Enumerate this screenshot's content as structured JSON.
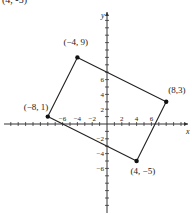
{
  "chart_data": {
    "type": "scatter",
    "title": "",
    "xlabel": "x",
    "ylabel": "y",
    "xlim": [
      -10,
      10
    ],
    "ylim": [
      -12,
      12
    ],
    "grid": false,
    "x_tick_labels": [
      "-6",
      "-4",
      "-2",
      "2",
      "4",
      "6"
    ],
    "y_tick_labels": [
      "6",
      "4",
      "2",
      "-2",
      "-4",
      "-6"
    ],
    "points": [
      {
        "x": -4,
        "y": 9,
        "label": "(-4, 9)"
      },
      {
        "x": 8,
        "y": 3,
        "label": "(8,3)"
      },
      {
        "x": 4,
        "y": -5,
        "label": "(4, -5)"
      },
      {
        "x": -8,
        "y": 1,
        "label": "(-8, 1)"
      }
    ],
    "polygon_order": [
      0,
      1,
      2,
      3
    ],
    "top_cropped_label": "(4, -5)"
  },
  "colors": {
    "line": "#222222",
    "point": "#111111",
    "axis": "#333333",
    "background": "#ffffff"
  }
}
